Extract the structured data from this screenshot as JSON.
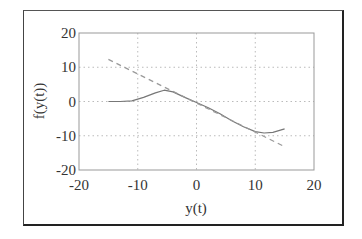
{
  "chart_data": {
    "type": "line",
    "title": "",
    "xlabel": "y(t)",
    "ylabel": "f(y(t))",
    "xlim": [
      -20,
      20
    ],
    "ylim": [
      -20,
      20
    ],
    "xticks": [
      -20,
      -10,
      0,
      10,
      20
    ],
    "yticks": [
      -20,
      -10,
      0,
      10,
      20
    ],
    "grid": true,
    "legend": null,
    "series": [
      {
        "name": "f(y(t))",
        "style": "solid",
        "color": "#777777",
        "x": [
          -15,
          -13,
          -11,
          -9,
          -7,
          -5.5,
          -4,
          -2,
          0,
          2,
          4,
          6,
          8,
          10,
          11.5,
          13,
          15
        ],
        "y": [
          0,
          0,
          0.2,
          1.2,
          2.5,
          3.3,
          2.8,
          1.2,
          -0.3,
          -1.8,
          -3.6,
          -5.6,
          -7.4,
          -8.8,
          -9.2,
          -9.0,
          -8.0
        ]
      },
      {
        "name": "linear",
        "style": "dashed",
        "color": "#999999",
        "x": [
          -15,
          15
        ],
        "y": [
          12.3,
          -13.2
        ]
      }
    ]
  },
  "axes": {
    "xlabel": "y(t)",
    "ylabel": "f(y(t))",
    "xtick_labels": [
      "-20",
      "-10",
      "0",
      "10",
      "20"
    ],
    "ytick_labels": [
      "20",
      "10",
      "0",
      "-10",
      "-20"
    ]
  }
}
